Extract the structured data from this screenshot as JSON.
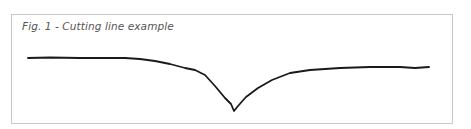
{
  "figure": {
    "caption": "Fig. 1 - Cutting line example",
    "line_color": "#1a1a1a",
    "frame_color": "#c8c8c8",
    "line_points": [
      [
        28,
        58
      ],
      [
        50,
        57.5
      ],
      [
        80,
        58
      ],
      [
        110,
        58
      ],
      [
        125,
        58
      ],
      [
        140,
        59
      ],
      [
        155,
        61
      ],
      [
        170,
        64
      ],
      [
        185,
        68
      ],
      [
        195,
        70
      ],
      [
        205,
        75
      ],
      [
        215,
        86
      ],
      [
        225,
        98
      ],
      [
        231,
        104
      ],
      [
        234,
        111
      ],
      [
        238,
        106
      ],
      [
        246,
        97
      ],
      [
        258,
        88
      ],
      [
        272,
        80
      ],
      [
        290,
        73
      ],
      [
        310,
        70
      ],
      [
        340,
        68
      ],
      [
        370,
        67
      ],
      [
        400,
        67
      ],
      [
        415,
        68
      ],
      [
        429,
        67
      ]
    ]
  }
}
